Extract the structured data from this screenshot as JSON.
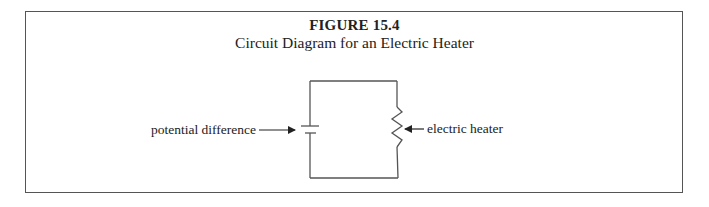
{
  "figure": {
    "number_label": "FIGURE 15.4",
    "caption": "Circuit Diagram for an Electric Heater"
  },
  "circuit": {
    "components": [
      {
        "type": "battery",
        "label": "potential difference",
        "side": "left"
      },
      {
        "type": "resistor",
        "label": "electric heater",
        "side": "right"
      }
    ],
    "connection": "series loop"
  },
  "labels": {
    "left": "potential difference",
    "right": "electric heater"
  },
  "colors": {
    "line": "#555555",
    "text": "#222222",
    "background": "#ffffff"
  }
}
